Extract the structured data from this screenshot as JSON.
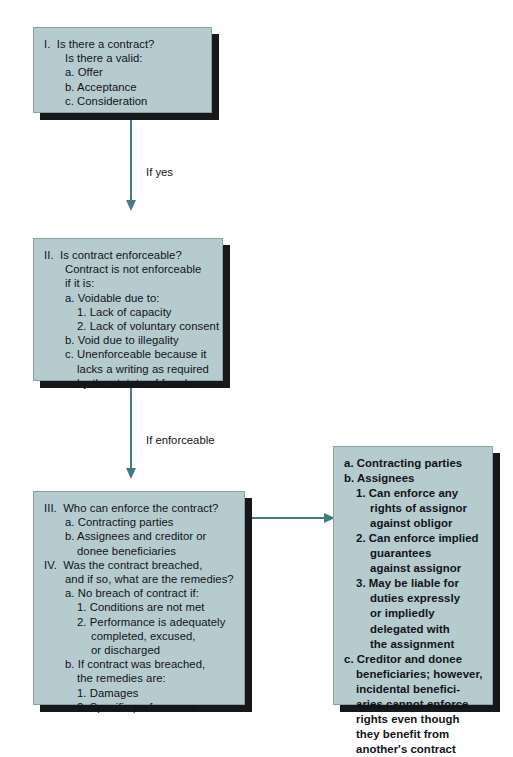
{
  "diagram": {
    "colors": {
      "box_fill": "#b5cbce",
      "box_border": "#8aa2a6",
      "box_shadow": "#16181c",
      "connector": "#3f7d82",
      "text": "#111318",
      "page_background": "#ffffff"
    }
  },
  "nodes": [
    {
      "id": "step-1",
      "bold": false,
      "lines": [
        {
          "text": "I.  Is there a contract?",
          "level": "roman"
        },
        {
          "text": "Is there a valid:",
          "level": "1"
        },
        {
          "text": "a. Offer",
          "level": "1"
        },
        {
          "text": "b. Acceptance",
          "level": "1"
        },
        {
          "text": "c. Consideration",
          "level": "1"
        }
      ]
    },
    {
      "id": "step-2",
      "bold": false,
      "lines": [
        {
          "text": "II.  Is contract enforceable?",
          "level": "roman"
        },
        {
          "text": "Contract is not enforceable",
          "level": "1"
        },
        {
          "text": "if it is:",
          "level": "1"
        },
        {
          "text": "a. Voidable due to:",
          "level": "1"
        },
        {
          "text": "1. Lack of capacity",
          "level": "2"
        },
        {
          "text": "2. Lack of voluntary consent",
          "level": "2"
        },
        {
          "text": "b. Void due to illegality",
          "level": "1"
        },
        {
          "text": "c. Unenforceable because it",
          "level": "1"
        },
        {
          "text": "lacks a writing as required",
          "level": "2"
        },
        {
          "text": "by the statute of frauds",
          "level": "2"
        }
      ]
    },
    {
      "id": "step-3",
      "bold": false,
      "lines": [
        {
          "text": "III.  Who can enforce the contract?",
          "level": "roman"
        },
        {
          "text": "a. Contracting parties",
          "level": "1"
        },
        {
          "text": "b. Assignees and creditor or",
          "level": "1"
        },
        {
          "text": "donee beneficiaries",
          "level": "2"
        },
        {
          "text": "IV.  Was the contract breached,",
          "level": "roman"
        },
        {
          "text": "and if so, what are the remedies?",
          "level": "1"
        },
        {
          "text": "a. No breach of contract if:",
          "level": "1"
        },
        {
          "text": "1. Conditions are not met",
          "level": "2"
        },
        {
          "text": "2. Performance is adequately",
          "level": "2"
        },
        {
          "text": "completed, excused,",
          "level": "3"
        },
        {
          "text": "or discharged",
          "level": "3"
        },
        {
          "text": "b. If contract was breached,",
          "level": "1"
        },
        {
          "text": "the remedies are:",
          "level": "2"
        },
        {
          "text": "1. Damages",
          "level": "2"
        },
        {
          "text": "2. Specific performance",
          "level": "2"
        }
      ]
    },
    {
      "id": "enforcement-detail",
      "bold": true,
      "lines": [
        {
          "text": "a. Contracting parties",
          "level": "roman"
        },
        {
          "text": "b. Assignees",
          "level": "roman"
        },
        {
          "text": "1. Can enforce any",
          "level": "1"
        },
        {
          "text": "rights of assignor",
          "level": "2"
        },
        {
          "text": "against obligor",
          "level": "2"
        },
        {
          "text": "2. Can enforce implied",
          "level": "1"
        },
        {
          "text": "guarantees",
          "level": "2"
        },
        {
          "text": "against assignor",
          "level": "2"
        },
        {
          "text": "3. May be liable for",
          "level": "1"
        },
        {
          "text": "duties expressly",
          "level": "2"
        },
        {
          "text": "or impliedly",
          "level": "2"
        },
        {
          "text": "delegated with",
          "level": "2"
        },
        {
          "text": "the assignment",
          "level": "2"
        },
        {
          "text": "c. Creditor and donee",
          "level": "roman"
        },
        {
          "text": "beneficiaries; however,",
          "level": "1"
        },
        {
          "text": "incidental benefici-",
          "level": "1"
        },
        {
          "text": "aries cannot enforce",
          "level": "1"
        },
        {
          "text": "rights even though",
          "level": "1"
        },
        {
          "text": "they benefit from",
          "level": "1"
        },
        {
          "text": "another's contract",
          "level": "1"
        }
      ]
    }
  ],
  "connectors": [
    {
      "id": "conn-1",
      "label": "If yes",
      "direction": "down"
    },
    {
      "id": "conn-2",
      "label": "If enforceable",
      "direction": "down"
    },
    {
      "id": "conn-3",
      "label": "",
      "direction": "right"
    }
  ]
}
